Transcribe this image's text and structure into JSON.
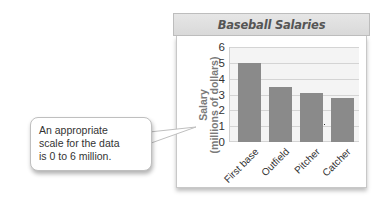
{
  "chart_data": {
    "type": "bar",
    "title": "Baseball Salaries",
    "xlabel": "",
    "ylabel": "Salary (millions of dollars)",
    "ylabel_lines": [
      "Salary",
      "(millions of dollars)"
    ],
    "categories": [
      "First base",
      "Outfield",
      "Pitcher",
      "Catcher"
    ],
    "values": [
      5.0,
      3.5,
      3.1,
      2.8
    ],
    "ylim": [
      0,
      6
    ],
    "yticks": [
      0,
      1,
      2,
      3,
      4,
      5,
      6
    ],
    "grid": true,
    "legend": null,
    "bar_color": "#8a8a8a",
    "annotation": "An appropriate scale for the data is 0 to 6 million."
  },
  "callout": {
    "lines": [
      "An appropriate",
      "scale for the data",
      "is 0 to 6 million."
    ]
  }
}
